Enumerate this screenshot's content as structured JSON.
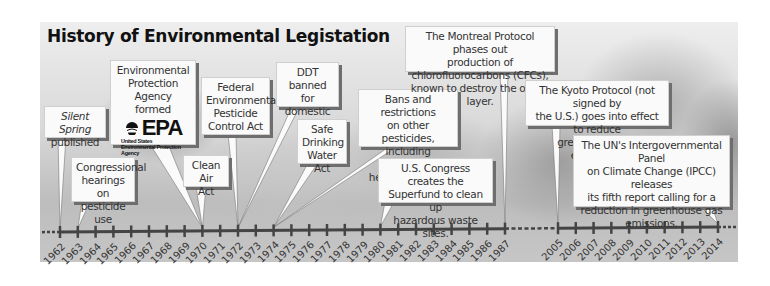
{
  "title": "History of Environmental Legistation",
  "timeline": {
    "segment1_years": [
      "1962",
      "1963",
      "1964",
      "1965",
      "1966",
      "1967",
      "1968",
      "1969",
      "1970",
      "1971",
      "1972",
      "1973",
      "1974",
      "1975",
      "1976",
      "1977",
      "1978",
      "1979",
      "1980",
      "1981",
      "1982",
      "1983",
      "1984",
      "1985",
      "1986",
      "1987"
    ],
    "segment2_years": [
      "2005",
      "2006",
      "2007",
      "2008",
      "2009",
      "2010",
      "2011",
      "2012",
      "2013",
      "2014"
    ]
  },
  "events": {
    "silent_spring": {
      "year": "1962",
      "italic": "Silent Spring",
      "text": "published"
    },
    "hearings": {
      "year": "1963",
      "line1": "Congressional",
      "line2": "hearings on",
      "line3": "pesticide use"
    },
    "epa": {
      "year": "1970",
      "line1": "Environmental",
      "line2": "Protection Agency",
      "line3": "formed",
      "logo_mark": "EPA",
      "logo_sub1": "United States",
      "logo_sub2": "Environmental Protection",
      "logo_sub3": "Agency"
    },
    "clean_air": {
      "year": "1970",
      "line1": "Clean Air",
      "line2": "Act"
    },
    "fepca": {
      "year": "1972",
      "line1": "Federal",
      "line2": "Environmental",
      "line3": "Pesticide",
      "line4": "Control Act"
    },
    "ddt": {
      "year": "1972",
      "line1": "DDT",
      "line2": "banned for",
      "line3": "domestic use"
    },
    "sdwa": {
      "year": "1974",
      "line1": "Safe",
      "line2": "Drinking",
      "line3": "Water Act"
    },
    "bans": {
      "year": "1974",
      "line1": "Bans and restrictions",
      "line2": "on other pesticides,",
      "line3": "including chlordane,",
      "line4": "heptachlor, and aldrin"
    },
    "superfund": {
      "year": "1980",
      "line1": "U.S. Congress creates the",
      "line2": "Superfund to clean up",
      "line3": "hazardous waste sites."
    },
    "montreal": {
      "year": "1987",
      "line1": "The Montreal Protocol phases out",
      "line2": "production of chlorofluorocarbons (CFCs),",
      "line3": "known to destroy the ozone layer."
    },
    "kyoto": {
      "year": "2005",
      "line1": "The Kyoto Protocol (not signed by",
      "line2": "the U.S.) goes into effect to reduce",
      "line3": "greenhouse gas emissions."
    },
    "ipcc": {
      "year": "2014",
      "line1": "The UN's Intergovernmental Panel",
      "line2": "on Climate Change (IPCC) releases",
      "line3": "its fifth report calling for a",
      "line4": "reduction in greenhouse gas",
      "line5": "emissions."
    }
  },
  "colors": {
    "line": "#444444",
    "box_fill": "#fafafa",
    "box_shadow": "#6e6e6e",
    "title": "#111111"
  }
}
